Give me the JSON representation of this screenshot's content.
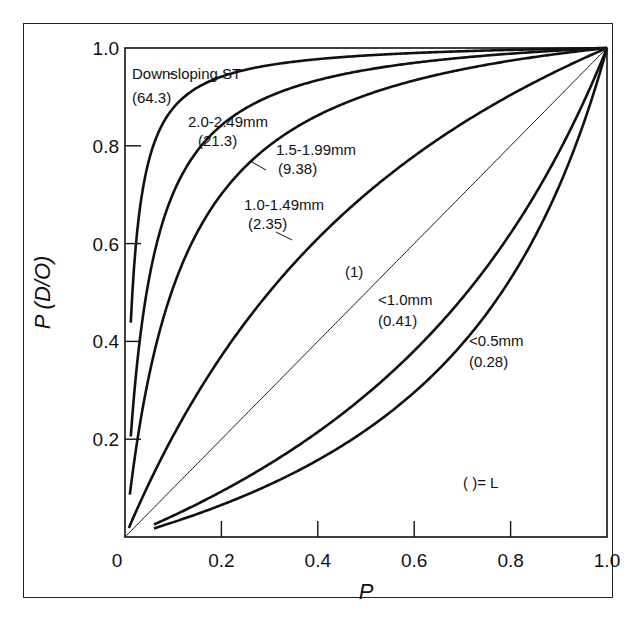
{
  "chart_data": {
    "type": "line",
    "title": "",
    "xlabel": "P",
    "ylabel": "P (D/O)",
    "xlim": [
      0,
      1.0
    ],
    "ylim": [
      0,
      1.0
    ],
    "grid": false,
    "x_ticks": [
      "0",
      "0.2",
      "0.4",
      "0.6",
      "0.8",
      "1.0"
    ],
    "y_ticks": [
      "0.2",
      "0.4",
      "0.6",
      "0.8",
      "1.0"
    ],
    "legend_note": "(   )= L",
    "series": [
      {
        "name": "Downsloping ST",
        "L": 64.3,
        "label": "Downsloping ST",
        "sublabel": "(64.3)"
      },
      {
        "name": "2.0-2.49mm",
        "L": 21.3,
        "label": "2.0-2.49mm",
        "sublabel": "(21.3)"
      },
      {
        "name": "1.5-1.99mm",
        "L": 9.38,
        "label": "1.5-1.99mm",
        "sublabel": "(9.38)"
      },
      {
        "name": "1.0-1.49mm",
        "L": 2.35,
        "label": "1.0-1.49mm",
        "sublabel": "(2.35)"
      },
      {
        "name": "(1)",
        "L": 1,
        "label": "",
        "sublabel": "(1)"
      },
      {
        "name": "<1.0mm",
        "L": 0.41,
        "label": "<1.0mm",
        "sublabel": "(0.41)"
      },
      {
        "name": "<0.5mm",
        "L": 0.28,
        "label": "<0.5mm",
        "sublabel": "(0.28)"
      }
    ],
    "formula": "P(D/O) = L*P / (L*P + (1 - P))"
  },
  "plot": {
    "x0": 125,
    "x1": 607,
    "y0": 537,
    "y1": 48
  }
}
